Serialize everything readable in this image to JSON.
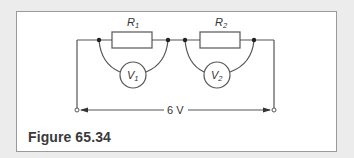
{
  "figure": {
    "caption": "Figure 65.34"
  },
  "circuit": {
    "resistors": [
      {
        "label": "R",
        "subscript": "1"
      },
      {
        "label": "R",
        "subscript": "2"
      }
    ],
    "voltmeters": [
      {
        "label": "V",
        "subscript": "1"
      },
      {
        "label": "V",
        "subscript": "2"
      }
    ],
    "supply": {
      "label": "6 V"
    }
  },
  "colors": {
    "wire": "#555555",
    "background": "#ececec",
    "panel": "#ffffff",
    "frame_border": "#9a9a9a"
  }
}
